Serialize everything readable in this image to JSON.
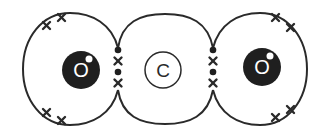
{
  "diagram": {
    "atoms": [
      {
        "id": "oxygen-left",
        "symbol": "O",
        "style": "dark"
      },
      {
        "id": "carbon",
        "symbol": "C",
        "style": "light"
      },
      {
        "id": "oxygen-right",
        "symbol": "O",
        "style": "dark"
      }
    ],
    "bonds": [
      {
        "between": [
          "oxygen-left",
          "carbon"
        ],
        "type": "double",
        "shared_electrons": [
          "dot",
          "cross",
          "dot",
          "cross"
        ]
      },
      {
        "between": [
          "carbon",
          "oxygen-right"
        ],
        "type": "double",
        "shared_electrons": [
          "dot",
          "cross",
          "dot",
          "cross"
        ]
      }
    ],
    "lone_pairs": {
      "oxygen-left": [
        "cross-pair-top",
        "cross-pair-bottom"
      ],
      "oxygen-right": [
        "cross-pair-top",
        "cross-pair-bottom"
      ]
    },
    "colors": {
      "line": "#2a2a2a",
      "nucleus_dark": "#1f1f1f",
      "background": "#ffffff"
    }
  }
}
